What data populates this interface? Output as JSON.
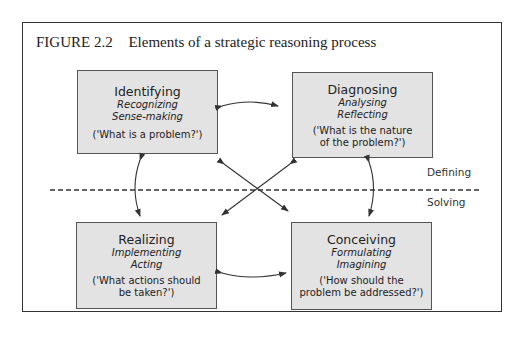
{
  "figure": {
    "number": "FIGURE 2.2",
    "title": "Elements of a strategic reasoning process"
  },
  "boxes": [
    {
      "id": "identifying",
      "title": "Identifying",
      "subtitles": [
        "Recognizing",
        "Sense-making"
      ],
      "question_lines": [
        "('What is a problem?')"
      ]
    },
    {
      "id": "diagnosing",
      "title": "Diagnosing",
      "subtitles": [
        "Analysing",
        "Reflecting"
      ],
      "question_lines": [
        "('What is the nature",
        "of the problem?')"
      ]
    },
    {
      "id": "realizing",
      "title": "Realizing",
      "subtitles": [
        "Implementing",
        "Acting"
      ],
      "question_lines": [
        "('What actions should",
        "be taken?')"
      ]
    },
    {
      "id": "conceiving",
      "title": "Conceiving",
      "subtitles": [
        "Formulating",
        "Imagining"
      ],
      "question_lines": [
        "('How should the",
        "problem be addressed?')"
      ]
    }
  ],
  "divider": {
    "upper_label": "Defining",
    "lower_label": "Solving"
  },
  "colors": {
    "box_fill": "#e3e3e3",
    "line": "#333333"
  }
}
